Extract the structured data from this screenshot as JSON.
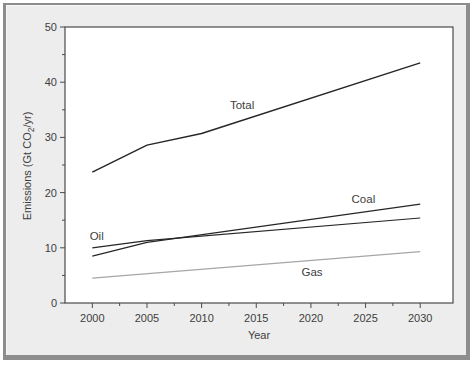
{
  "chart_data": {
    "type": "line",
    "title": "",
    "xlabel": "Year",
    "ylabel": "Emissions (Gt CO2/yr)",
    "ylabel_parts": {
      "prefix": "Emissions (Gt CO",
      "sub": "2",
      "suffix": "/yr)"
    },
    "xlim": [
      1997.5,
      2033
    ],
    "ylim": [
      0,
      50
    ],
    "grid": false,
    "legend": "inline-labels",
    "x_ticks": [
      {
        "v": 2000,
        "label": "2000"
      },
      {
        "v": 2005,
        "label": "2005"
      },
      {
        "v": 2010,
        "label": "2010"
      },
      {
        "v": 2015,
        "label": "2015"
      },
      {
        "v": 2020,
        "label": "2020"
      },
      {
        "v": 2025,
        "label": "2025"
      },
      {
        "v": 2030,
        "label": "2030"
      }
    ],
    "x_minor_ticks": [
      2002.5,
      2007.5,
      2012.5,
      2017.5,
      2022.5,
      2027.5
    ],
    "y_ticks": [
      {
        "v": 0,
        "label": "0"
      },
      {
        "v": 10,
        "label": "10"
      },
      {
        "v": 20,
        "label": "20"
      },
      {
        "v": 30,
        "label": "30"
      },
      {
        "v": 40,
        "label": "40"
      },
      {
        "v": 50,
        "label": "50"
      }
    ],
    "y_minor_ticks": [
      5,
      15,
      25,
      35,
      45
    ],
    "series": [
      {
        "name": "Total",
        "label": "Total",
        "color": "#262626",
        "width": 1.4,
        "points": [
          [
            2000,
            23.7
          ],
          [
            2005,
            28.6
          ],
          [
            2010,
            30.7
          ],
          [
            2030,
            43.5
          ]
        ],
        "label_pos": [
          2013.7,
          35.9
        ]
      },
      {
        "name": "Coal",
        "label": "Coal",
        "color": "#262626",
        "width": 1.2,
        "points": [
          [
            2000,
            8.5
          ],
          [
            2005,
            11.0
          ],
          [
            2030,
            17.9
          ]
        ],
        "label_pos": [
          2024.8,
          18.8
        ]
      },
      {
        "name": "Oil",
        "label": "Oil",
        "color": "#262626",
        "width": 1.2,
        "points": [
          [
            2000,
            10.0
          ],
          [
            2005,
            11.3
          ],
          [
            2030,
            15.4
          ]
        ],
        "label_pos": [
          2000.4,
          12.1
        ]
      },
      {
        "name": "Gas",
        "label": "Gas",
        "color": "#a6a6a6",
        "width": 1.2,
        "points": [
          [
            2000,
            4.5
          ],
          [
            2030,
            9.3
          ]
        ],
        "label_pos": [
          2020.1,
          5.6
        ]
      }
    ]
  }
}
